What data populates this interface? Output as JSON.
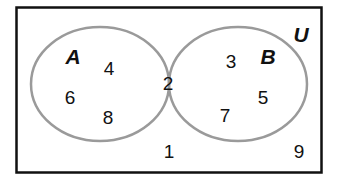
{
  "diagram": {
    "type": "venn",
    "universe": {
      "label": "U",
      "elements_outside": [
        "1",
        "9"
      ]
    },
    "sets": [
      {
        "label": "A",
        "only_elements": [
          "4",
          "6",
          "8"
        ]
      },
      {
        "label": "B",
        "only_elements": [
          "3",
          "5",
          "7"
        ]
      }
    ],
    "intersection": {
      "elements": [
        "2"
      ],
      "shaded": true
    },
    "labels": {
      "U": "U",
      "A": "A",
      "B": "B",
      "n4": "4",
      "n6": "6",
      "n8": "8",
      "n2": "2",
      "n3": "3",
      "n5": "5",
      "n7": "7",
      "n1": "1",
      "n9": "9"
    },
    "colors": {
      "frame": "#111111",
      "circle_stroke": "#9a9a9a",
      "intersection_fill": "#e6e6e6",
      "background": "#ffffff",
      "text": "#111111"
    }
  }
}
